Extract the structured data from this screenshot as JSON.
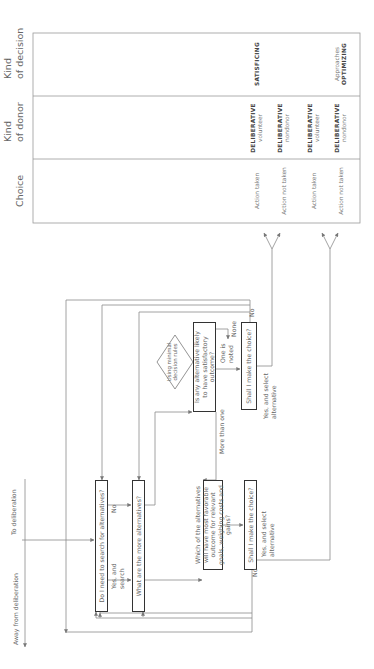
{
  "flow": {
    "inputs": {
      "to_deliberation": "To deliberation",
      "away_from_deliberation": "Away from deliberation"
    },
    "boxes": {
      "search": "Do I need to search for alternatives?",
      "more_alternatives": "What are the more alternatives?",
      "which_alternative": "Which of the alternatives will have most favorable outcome for relevant goals, weighing costs and gains?",
      "satisfactory": "Is any alternative likely to have satisfactory outcome?",
      "shall_upper": "Shall I make the choice?",
      "shall_lower": "Shall I make the choice?"
    },
    "diamond": "Using minimal decision rules",
    "edge_labels": {
      "no_search": "No",
      "yes_search": "Yes, and search",
      "more_than_one": "More than one",
      "one_noted": "One is noted",
      "none": "None",
      "no_upper": "No",
      "no_lower": "No",
      "yes_select_upper": "Yes, and select alternative",
      "yes_select_lower": "Yes, and select alternative"
    }
  },
  "table": {
    "headers": {
      "choice": "Choice",
      "donor_line1": "Kind",
      "donor_line2": "of donor",
      "decision_line1": "Kind",
      "decision_line2": "of decision"
    },
    "rows": [
      {
        "choice": "Action taken",
        "donor_bold": "DELIBERATIVE",
        "donor_sub": "volunteer"
      },
      {
        "choice": "Action not taken",
        "donor_bold": "DELIBERATIVE",
        "donor_sub": "nondonor"
      },
      {
        "choice": "Action taken",
        "donor_bold": "DELIBERATIVE",
        "donor_sub": "volunteer"
      },
      {
        "choice": "Action not taken",
        "donor_bold": "DELIBERATIVE",
        "donor_sub": "nondonor"
      }
    ],
    "decisions": {
      "satisficing": "SATISFICING",
      "optimizing_prefix": "Approaches",
      "optimizing": "OPTIMIZING"
    }
  },
  "colors": {
    "line": "#888888",
    "box_border": "#333333",
    "text": "#666666"
  }
}
